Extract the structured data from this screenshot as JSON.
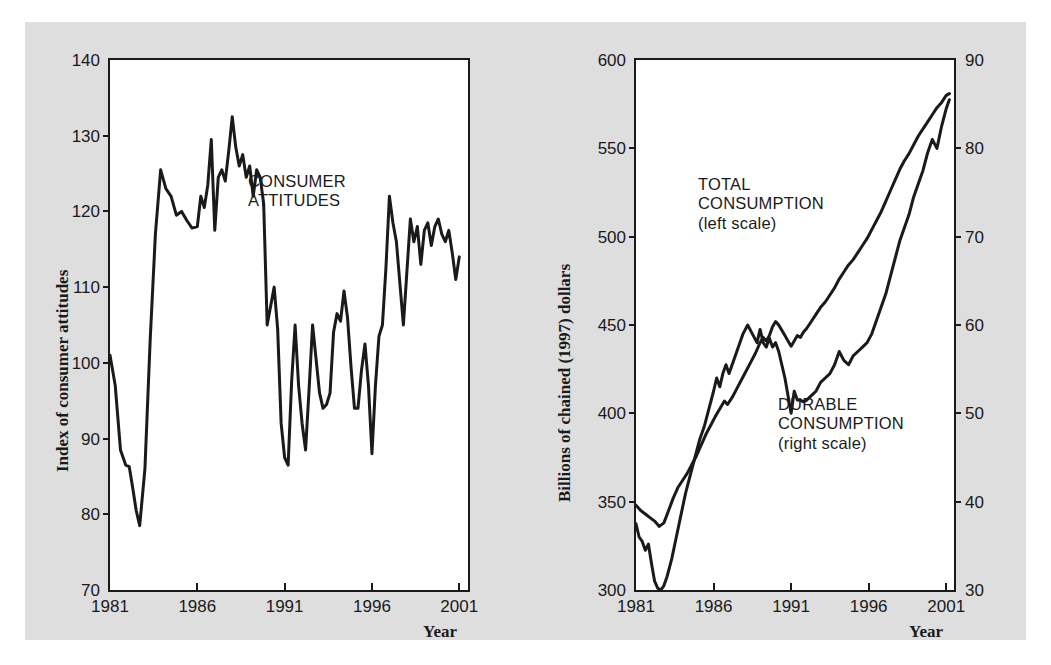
{
  "figure": {
    "background_color": "#dedede",
    "line_color": "#1a1a1a",
    "panels": [
      "consumer-attitudes",
      "consumption"
    ]
  },
  "chart_data": [
    {
      "type": "line",
      "id": "consumer-attitudes",
      "title": "",
      "xlabel": "Year",
      "ylabel": "Index of consumer attitudes",
      "xlim": [
        1981,
        2001.5
      ],
      "ylim": [
        70,
        140
      ],
      "xticks": [
        1981,
        1986,
        1991,
        1996,
        2001
      ],
      "xticklabels": [
        "1981",
        "1986",
        "1991",
        "1996",
        "2001"
      ],
      "yticks": [
        70,
        80,
        90,
        100,
        110,
        120,
        130,
        140
      ],
      "yticklabels": [
        "70",
        "80",
        "90",
        "100",
        "110",
        "120",
        "130",
        "140"
      ],
      "grid": false,
      "legend": "none",
      "annotations": [
        {
          "text": "CONSUMER\nATTITUDES",
          "x": 1988.3,
          "y": 121.5
        }
      ],
      "series": [
        {
          "name": "CONSUMER ATTITUDES",
          "x": [
            1981.0,
            1981.3,
            1981.6,
            1981.9,
            1982.1,
            1982.3,
            1982.5,
            1982.7,
            1983.0,
            1983.3,
            1983.6,
            1983.9,
            1984.2,
            1984.5,
            1984.8,
            1985.1,
            1985.4,
            1985.7,
            1986.0,
            1986.2,
            1986.4,
            1986.6,
            1986.8,
            1987.0,
            1987.2,
            1987.4,
            1987.6,
            1987.8,
            1988.0,
            1988.2,
            1988.4,
            1988.6,
            1988.8,
            1989.0,
            1989.2,
            1989.4,
            1989.6,
            1989.8,
            1990.0,
            1990.2,
            1990.4,
            1990.6,
            1990.8,
            1991.0,
            1991.2,
            1991.4,
            1991.6,
            1991.8,
            1992.0,
            1992.2,
            1992.4,
            1992.6,
            1992.8,
            1993.0,
            1993.2,
            1993.4,
            1993.6,
            1993.8,
            1994.0,
            1994.2,
            1994.4,
            1994.6,
            1994.8,
            1995.0,
            1995.2,
            1995.4,
            1995.6,
            1995.8,
            1996.0,
            1996.2,
            1996.4,
            1996.6,
            1996.8,
            1997.0,
            1997.2,
            1997.4,
            1997.6,
            1997.8,
            1998.0,
            1998.2,
            1998.4,
            1998.6,
            1998.8,
            1999.0,
            1999.2,
            1999.4,
            1999.6,
            1999.8,
            2000.0,
            2000.2,
            2000.4,
            2000.6,
            2000.8,
            2001.0
          ],
          "y": [
            101.0,
            97.0,
            88.5,
            86.5,
            86.3,
            83.5,
            80.5,
            78.5,
            86.0,
            103.0,
            117.0,
            125.5,
            123.0,
            122.0,
            119.5,
            120.0,
            118.8,
            117.8,
            118.0,
            122.0,
            120.5,
            123.5,
            129.5,
            117.5,
            124.5,
            125.5,
            124.0,
            128.0,
            132.5,
            128.5,
            126.0,
            127.5,
            124.5,
            126.0,
            122.0,
            125.5,
            124.5,
            121.0,
            105.0,
            107.5,
            110.0,
            104.5,
            92.0,
            87.5,
            86.5,
            97.5,
            105.0,
            97.0,
            92.0,
            88.5,
            96.5,
            105.0,
            100.5,
            96.0,
            94.0,
            94.5,
            96.0,
            104.0,
            106.5,
            105.5,
            109.5,
            106.0,
            99.5,
            94.0,
            94.0,
            99.0,
            102.5,
            97.0,
            88.0,
            97.0,
            103.5,
            105.0,
            112.5,
            122.0,
            118.5,
            116.0,
            110.5,
            105.0,
            112.0,
            119.0,
            116.0,
            118.0,
            113.0,
            117.5,
            118.5,
            115.5,
            118.0,
            119.0,
            117.0,
            116.0,
            117.5,
            114.5,
            111.0,
            114.0
          ]
        }
      ]
    },
    {
      "type": "line",
      "id": "consumption",
      "title": "",
      "xlabel": "Year",
      "ylabel": "Billions of chained (1997) dollars",
      "xlim": [
        1981,
        2001.5
      ],
      "ylim": [
        300,
        600
      ],
      "ylim_right": [
        30,
        90
      ],
      "xticks": [
        1981,
        1986,
        1991,
        1996,
        2001
      ],
      "xticklabels": [
        "1981",
        "1986",
        "1991",
        "1996",
        "2001"
      ],
      "yticks": [
        300,
        350,
        400,
        450,
        500,
        550,
        600
      ],
      "yticklabels": [
        "300",
        "350",
        "400",
        "450",
        "500",
        "550",
        "600"
      ],
      "yticks_right": [
        30,
        40,
        50,
        60,
        70,
        80,
        90
      ],
      "yticklabels_right": [
        "30",
        "40",
        "50",
        "60",
        "70",
        "80",
        "90"
      ],
      "grid": false,
      "legend": "none",
      "annotations": [
        {
          "text": "TOTAL\nCONSUMPTION\n(left scale)",
          "x": 1989.0,
          "y": 510.0
        },
        {
          "text": "DURABLE\nCONSUMPTION\n(right scale)",
          "x": 1993.6,
          "y": 398.0
        }
      ],
      "series": [
        {
          "name": "TOTAL CONSUMPTION",
          "scale": "left",
          "units": "Billions of chained (1997) dollars",
          "x": [
            1981.0,
            1981.3,
            1981.6,
            1981.9,
            1982.2,
            1982.5,
            1982.8,
            1983.1,
            1983.4,
            1983.7,
            1984.0,
            1984.3,
            1984.6,
            1984.9,
            1985.2,
            1985.5,
            1985.8,
            1986.1,
            1986.3,
            1986.5,
            1986.7,
            1986.9,
            1987.2,
            1987.5,
            1987.8,
            1988.1,
            1988.4,
            1988.7,
            1989.0,
            1989.2,
            1989.4,
            1989.6,
            1989.8,
            1990.0,
            1990.2,
            1990.4,
            1990.6,
            1990.8,
            1991.0,
            1991.2,
            1991.4,
            1991.6,
            1991.8,
            1992.0,
            1992.3,
            1992.6,
            1992.9,
            1993.2,
            1993.5,
            1993.8,
            1994.1,
            1994.4,
            1994.7,
            1995.0,
            1995.3,
            1995.6,
            1995.9,
            1996.2,
            1996.5,
            1996.8,
            1997.1,
            1997.4,
            1997.7,
            1998.0,
            1998.3,
            1998.6,
            1998.9,
            1999.2,
            1999.5,
            1999.8,
            2000.1,
            2000.4,
            2000.7,
            2001.0,
            2001.2
          ],
          "y": [
            348.0,
            345.0,
            343.0,
            341.0,
            339.0,
            336.0,
            338.0,
            345.0,
            352.0,
            358.0,
            362.0,
            366.0,
            371.0,
            376.0,
            382.0,
            388.0,
            393.0,
            398.0,
            401.0,
            404.0,
            407.0,
            405.0,
            409.0,
            414.0,
            419.0,
            424.0,
            429.0,
            434.0,
            440.0,
            443.0,
            441.0,
            444.0,
            449.0,
            452.0,
            450.0,
            447.0,
            444.0,
            441.0,
            438.0,
            441.0,
            444.0,
            443.0,
            446.0,
            448.0,
            452.0,
            456.0,
            460.0,
            463.0,
            467.0,
            471.0,
            476.0,
            480.0,
            484.0,
            487.0,
            491.0,
            495.0,
            499.0,
            504.0,
            509.0,
            514.0,
            520.0,
            526.0,
            532.0,
            538.0,
            543.0,
            547.0,
            552.0,
            557.0,
            561.0,
            565.0,
            569.0,
            573.0,
            576.0,
            580.0,
            581.0
          ]
        },
        {
          "name": "DURABLE CONSUMPTION",
          "scale": "right",
          "units": "Billions of chained (1997) dollars",
          "x": [
            1981.0,
            1981.2,
            1981.4,
            1981.6,
            1981.8,
            1982.0,
            1982.2,
            1982.4,
            1982.6,
            1982.8,
            1983.0,
            1983.3,
            1983.6,
            1983.9,
            1984.2,
            1984.5,
            1984.8,
            1985.1,
            1985.4,
            1985.7,
            1986.0,
            1986.2,
            1986.4,
            1986.6,
            1986.8,
            1987.0,
            1987.3,
            1987.6,
            1987.9,
            1988.2,
            1988.5,
            1988.8,
            1989.0,
            1989.2,
            1989.4,
            1989.6,
            1989.8,
            1990.0,
            1990.2,
            1990.4,
            1990.6,
            1990.8,
            1991.0,
            1991.2,
            1991.4,
            1991.6,
            1991.8,
            1992.0,
            1992.3,
            1992.6,
            1992.9,
            1993.2,
            1993.5,
            1993.8,
            1994.1,
            1994.4,
            1994.7,
            1995.0,
            1995.3,
            1995.6,
            1995.9,
            1996.2,
            1996.5,
            1996.8,
            1997.1,
            1997.4,
            1997.7,
            1998.0,
            1998.3,
            1998.6,
            1998.9,
            1999.2,
            1999.5,
            1999.8,
            2000.1,
            2000.4,
            2000.7,
            2001.0,
            2001.2
          ],
          "y": [
            37.5,
            36.0,
            35.5,
            34.5,
            35.2,
            33.0,
            31.0,
            30.2,
            30.0,
            30.5,
            31.5,
            33.5,
            36.0,
            38.5,
            41.0,
            43.0,
            45.0,
            47.0,
            48.5,
            50.5,
            52.5,
            54.0,
            53.0,
            54.5,
            55.5,
            54.5,
            56.0,
            57.5,
            59.0,
            60.0,
            59.0,
            58.0,
            59.5,
            58.0,
            57.5,
            58.5,
            57.5,
            58.0,
            57.0,
            55.5,
            54.0,
            52.0,
            50.0,
            52.5,
            51.5,
            51.5,
            51.3,
            51.5,
            52.0,
            52.5,
            53.5,
            54.0,
            54.5,
            55.5,
            57.0,
            56.0,
            55.5,
            56.5,
            57.0,
            57.5,
            58.0,
            59.0,
            60.5,
            62.0,
            63.5,
            65.5,
            67.5,
            69.5,
            71.0,
            72.5,
            74.5,
            76.0,
            77.5,
            79.5,
            81.0,
            80.0,
            82.5,
            84.5,
            85.5
          ]
        }
      ]
    }
  ],
  "left_panel": {
    "y_axis_title": "Index of consumer attitudes",
    "x_axis_title": "Year",
    "annotation_line1": "CONSUMER",
    "annotation_line2": "ATTITUDES",
    "yticklabels": [
      "140",
      "130",
      "120",
      "110",
      "100",
      "90",
      "80",
      "70"
    ],
    "xticklabels": [
      "1981",
      "1986",
      "1991",
      "1996",
      "2001"
    ]
  },
  "right_panel": {
    "y_axis_title": "Billions of chained (1997) dollars",
    "x_axis_title": "Year",
    "annotation_total_line1": "TOTAL",
    "annotation_total_line2": "CONSUMPTION",
    "annotation_total_line3": "(left scale)",
    "annotation_durable_line1": "DURABLE",
    "annotation_durable_line2": "CONSUMPTION",
    "annotation_durable_line3": "(right scale)",
    "yticklabels_left": [
      "600",
      "550",
      "500",
      "450",
      "400",
      "350",
      "300"
    ],
    "yticklabels_right": [
      "90",
      "80",
      "70",
      "60",
      "50",
      "40",
      "30"
    ],
    "xticklabels": [
      "1981",
      "1986",
      "1991",
      "1996",
      "2001"
    ]
  }
}
